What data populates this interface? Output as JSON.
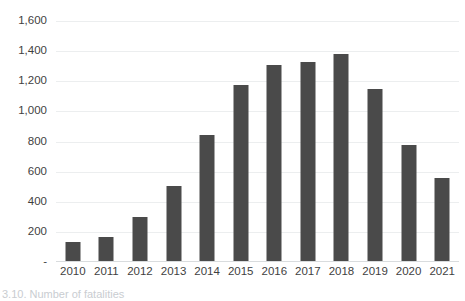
{
  "chart_data": {
    "type": "bar",
    "title": "",
    "subtitle": "",
    "xlabel": "",
    "ylabel": "",
    "categories": [
      "2010",
      "2011",
      "2012",
      "2013",
      "2014",
      "2015",
      "2016",
      "2017",
      "2018",
      "2019",
      "2020",
      "2021"
    ],
    "values": [
      133,
      166,
      300,
      505,
      845,
      1175,
      1310,
      1330,
      1380,
      1150,
      780,
      555
    ],
    "series": [
      {
        "name": "",
        "values": [
          133,
          166,
          300,
          505,
          845,
          1175,
          1310,
          1330,
          1380,
          1150,
          780,
          555
        ]
      }
    ],
    "ylim": [
      0,
      1600
    ],
    "ytick_values": [
      0,
      200,
      400,
      600,
      800,
      1000,
      1200,
      1400,
      1600
    ],
    "ytick_labels": [
      "-",
      "200",
      "400",
      "600",
      "800",
      "1,000",
      "1,200",
      "1,400",
      "1,600"
    ],
    "grid": true,
    "legend": false,
    "legend_position": "none",
    "bar_color": "#4a4a4a",
    "gridline_color": "#eceeef",
    "axis_color": "#d9dcde",
    "text_color": "#3f3f3f"
  },
  "caption": {
    "text": "3.10. Number of fatalities"
  }
}
